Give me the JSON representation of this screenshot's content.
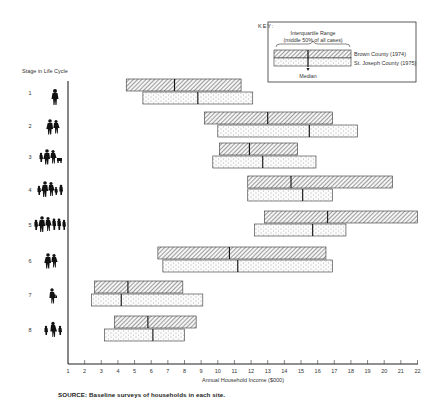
{
  "chart_data": {
    "type": "bar",
    "subtype": "floating-range (interquartile) with median markers",
    "title": "",
    "ylabel": "Stage in Life Cycle",
    "xlabel": "Annual Household Income ($000)",
    "xlim": [
      1,
      22
    ],
    "xticks": [
      1,
      2,
      3,
      4,
      5,
      6,
      7,
      8,
      9,
      10,
      11,
      12,
      13,
      14,
      15,
      16,
      17,
      18,
      19,
      20,
      21,
      22
    ],
    "grid": false,
    "legend_position": "top-right (boxed key)",
    "categories": [
      "1",
      "2",
      "3",
      "4",
      "5",
      "6",
      "7",
      "8"
    ],
    "series": [
      {
        "name": "Brown County (1974)",
        "pattern": "diagonal hatch",
        "q1": [
          4.5,
          9.2,
          10.1,
          11.8,
          12.8,
          6.4,
          2.6,
          3.8
        ],
        "median": [
          7.4,
          13.0,
          11.9,
          14.4,
          16.6,
          10.7,
          4.6,
          5.8
        ],
        "q3": [
          11.4,
          16.9,
          14.8,
          20.5,
          22.0,
          16.5,
          7.9,
          8.7
        ]
      },
      {
        "name": "St. Joseph County (1975)",
        "pattern": "stipple dots",
        "q1": [
          5.5,
          10.0,
          9.7,
          11.8,
          12.2,
          6.7,
          2.4,
          3.2
        ],
        "median": [
          8.8,
          15.5,
          12.7,
          15.1,
          15.7,
          11.2,
          4.2,
          6.1
        ],
        "q3": [
          12.1,
          18.4,
          15.9,
          16.9,
          17.7,
          16.9,
          9.1,
          8.0
        ]
      }
    ],
    "annotations": [
      "Interquartile Range (middle 50% of all cases)",
      "Median"
    ],
    "source": "SOURCE: Baseline surveys of households in each site."
  },
  "key": {
    "title": "KEY:",
    "range_label_line1": "Interquartile Range",
    "range_label_line2": "(middle 50% of all cases)",
    "series1": "Brown County (1974)",
    "series2": "St. Joseph County (1975)",
    "median_label": "Median"
  },
  "axis": {
    "y_title": "Stage in Life Cycle",
    "x_title": "Annual Household Income ($000)",
    "stages": [
      "1",
      "2",
      "3",
      "4",
      "5",
      "6",
      "7",
      "8"
    ],
    "stage_icons": [
      "single-adult-icon",
      "couple-icon",
      "couple-with-young-children-icon",
      "couple-with-children-icon",
      "large-family-icon",
      "older-couple-icon",
      "single-older-adult-icon",
      "single-parent-with-children-icon"
    ]
  },
  "source": "SOURCE:  Baseline surveys of households in each site.",
  "colors": {
    "ink": "#222222",
    "hatch": "#555555",
    "dots": "#777777",
    "background": "#ffffff"
  }
}
